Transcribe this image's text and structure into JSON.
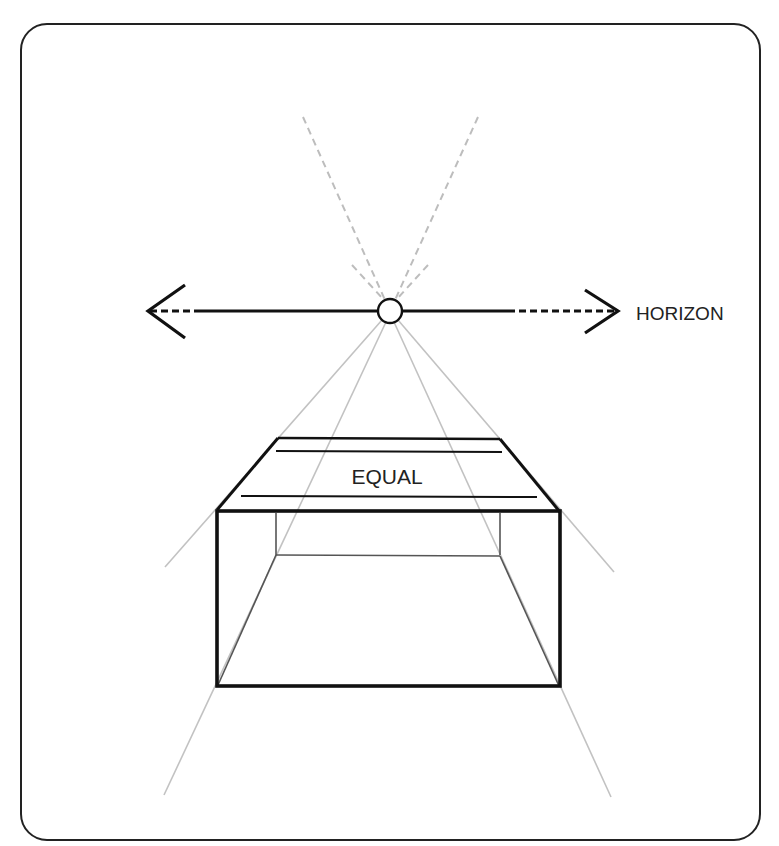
{
  "diagram": {
    "labels": {
      "horizon": "HORIZON",
      "equal": "EQUAL"
    },
    "colors": {
      "frame": "#222222",
      "ink": "#111111",
      "guide": "#b8b8b8",
      "background": "#ffffff"
    },
    "vanishing_point": {
      "x": 390,
      "y": 311,
      "r": 12
    }
  }
}
